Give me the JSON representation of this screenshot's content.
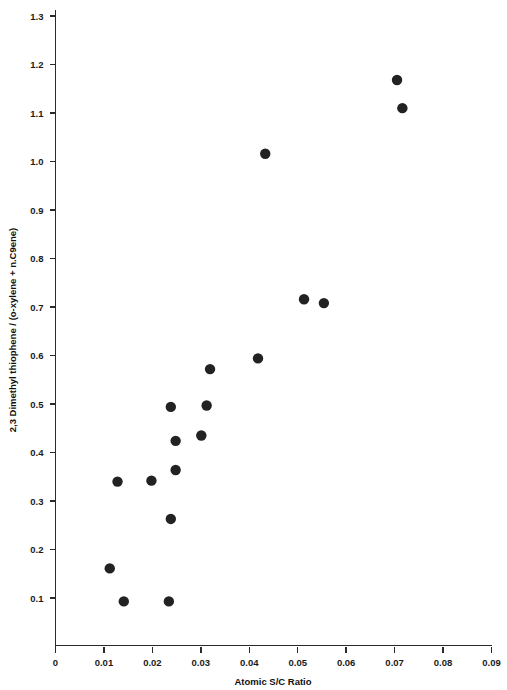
{
  "chart_data": {
    "type": "scatter",
    "title": "",
    "xlabel": "Atomic S/C Ratio",
    "ylabel": "2,3 Dimethyl thiophene / (o-xylene + n.C9ene)",
    "xlim": [
      0,
      0.09
    ],
    "ylim": [
      0,
      1.35
    ],
    "grid": false,
    "legend": "none",
    "xticks": [
      "0",
      "0.01",
      "0.02",
      "0.03",
      "0.04",
      "0.05",
      "0.06",
      "0.07",
      "0.08",
      "0.09"
    ],
    "xtick_values": [
      0,
      0.01,
      0.02,
      0.03,
      0.04,
      0.05,
      0.06,
      0.07,
      0.08,
      0.09
    ],
    "yticks": [
      "0.1",
      "0.2",
      "0.3",
      "0.4",
      "0.5",
      "0.6",
      "0.7",
      "0.8",
      "0.9",
      "1.0",
      "1.1",
      "1.2",
      "1.3"
    ],
    "ytick_values": [
      0.1,
      0.2,
      0.3,
      0.4,
      0.5,
      0.6,
      0.7,
      0.8,
      0.9,
      1.0,
      1.1,
      1.2,
      1.3
    ],
    "marker": "filled-circle",
    "marker_color": "#222222",
    "marker_size": 5.2,
    "x": [
      0.0112,
      0.0141,
      0.0234,
      0.0128,
      0.0198,
      0.0238,
      0.0248,
      0.0248,
      0.0238,
      0.0301,
      0.0312,
      0.0319,
      0.0418,
      0.0433,
      0.0513,
      0.0554,
      0.0705,
      0.0716
    ],
    "y": [
      0.161,
      0.093,
      0.093,
      0.34,
      0.342,
      0.263,
      0.364,
      0.424,
      0.494,
      0.435,
      0.497,
      0.572,
      0.594,
      1.016,
      0.716,
      0.708,
      1.168,
      1.11
    ],
    "points": [
      {
        "x": 0.0112,
        "y": 0.161
      },
      {
        "x": 0.0141,
        "y": 0.093
      },
      {
        "x": 0.0234,
        "y": 0.093
      },
      {
        "x": 0.0128,
        "y": 0.34
      },
      {
        "x": 0.0198,
        "y": 0.342
      },
      {
        "x": 0.0238,
        "y": 0.263
      },
      {
        "x": 0.0248,
        "y": 0.364
      },
      {
        "x": 0.0248,
        "y": 0.424
      },
      {
        "x": 0.0238,
        "y": 0.494
      },
      {
        "x": 0.0301,
        "y": 0.435
      },
      {
        "x": 0.0312,
        "y": 0.497
      },
      {
        "x": 0.0319,
        "y": 0.572
      },
      {
        "x": 0.0418,
        "y": 0.594
      },
      {
        "x": 0.0433,
        "y": 1.016
      },
      {
        "x": 0.0513,
        "y": 0.716
      },
      {
        "x": 0.0554,
        "y": 0.708
      },
      {
        "x": 0.0705,
        "y": 1.168
      },
      {
        "x": 0.0716,
        "y": 1.11
      }
    ]
  },
  "axes": {
    "x_title": "Atomic S/C Ratio",
    "y_title": "2,3 Dimethyl thiophene / (o-xylene + n.C9ene)"
  },
  "colors": {
    "axis": "#2b2b2b",
    "marker": "#222222",
    "background": "#ffffff"
  }
}
